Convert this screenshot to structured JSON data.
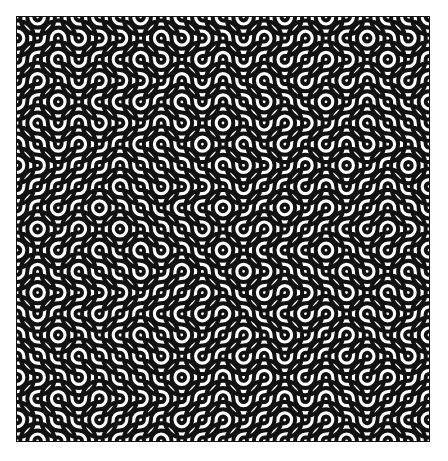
{
  "figure": {
    "type": "truchet-tiling",
    "grid": {
      "cols": 20,
      "rows": 20
    },
    "colors": {
      "stroke": "#111111",
      "background": "#ffffff"
    }
  }
}
